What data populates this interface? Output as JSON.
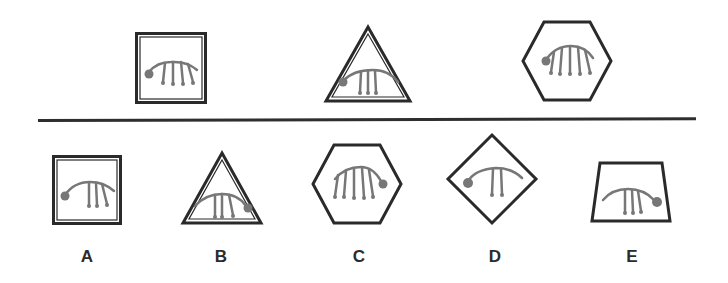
{
  "puzzle": {
    "type": "figure-sequence",
    "colors": {
      "frame": "#2a2a2a",
      "glyph": "#777777",
      "background": "#ffffff"
    },
    "sequence": [
      {
        "frame": "square",
        "strands": 4,
        "dot_side": "left"
      },
      {
        "frame": "triangle",
        "strands": 3,
        "dot_side": "left"
      },
      {
        "frame": "hexagon",
        "strands": 5,
        "dot_side": "left"
      }
    ],
    "options": [
      {
        "letter": "A",
        "frame": "square",
        "strands": 3,
        "dot_side": "left"
      },
      {
        "letter": "B",
        "frame": "triangle",
        "strands": 3,
        "dot_side": "right"
      },
      {
        "letter": "C",
        "frame": "hexagon",
        "strands": 5,
        "dot_side": "right"
      },
      {
        "letter": "D",
        "frame": "diamond",
        "strands": 2,
        "dot_side": "left"
      },
      {
        "letter": "E",
        "frame": "trapezoid",
        "strands": 3,
        "dot_side": "right"
      }
    ]
  }
}
